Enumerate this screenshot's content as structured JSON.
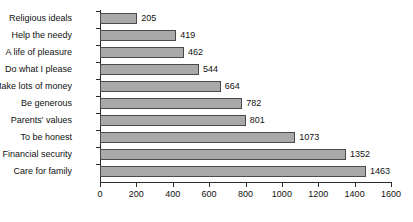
{
  "chart_data": {
    "type": "bar",
    "orientation": "horizontal",
    "title": "",
    "subtitle": "",
    "xlabel": "",
    "ylabel": "",
    "xlim": [
      0,
      1600
    ],
    "xticks": [
      0,
      200,
      400,
      600,
      800,
      1000,
      1200,
      1400,
      1600
    ],
    "xtick_labels": [
      "0",
      "200",
      "400",
      "600",
      "800",
      "1000",
      "1200",
      "1400",
      "1600"
    ],
    "grid": false,
    "legend": false,
    "legend_position": "none",
    "show_data_labels": true,
    "bar_fill_color": "#a9a9a9",
    "bar_edge_color": "#4a4a4a",
    "axis_color": "#2b2b2b",
    "background_color": "#ffffff",
    "categories": [
      "Religious ideals",
      "Help the needy",
      "A life of pleasure",
      "Do what I please",
      "Make lots of money",
      "Be generous",
      "Parents' values",
      "To be honest",
      "Financial security",
      "Care for family"
    ],
    "values": [
      205,
      419,
      462,
      544,
      664,
      782,
      801,
      1073,
      1352,
      1463
    ],
    "value_labels": [
      "205",
      "419",
      "462",
      "544",
      "664",
      "782",
      "801",
      "1073",
      "1352",
      "1463"
    ]
  }
}
